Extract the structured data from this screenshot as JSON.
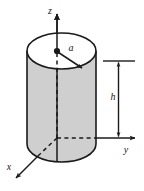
{
  "figure": {
    "kind": "engineering-diagram",
    "background_color": "#ffffff",
    "line_color": "#1a1a1a",
    "cylinder_fill_color": "#cfcfcf",
    "cylinder_top_fill_color": "#ffffff",
    "axes": [
      {
        "name": "z-axis",
        "label": "z",
        "direction": "up"
      },
      {
        "name": "y-axis",
        "label": "y",
        "direction": "right"
      },
      {
        "name": "x-axis",
        "label": "x",
        "direction": "down-left"
      }
    ],
    "annotations": [
      {
        "name": "radius-dimension",
        "label": "a",
        "target": "cylinder top face radius"
      },
      {
        "name": "height-dimension",
        "label": "h",
        "target": "cylinder height"
      }
    ],
    "markers": [
      {
        "name": "origin-point",
        "label": ""
      }
    ]
  }
}
